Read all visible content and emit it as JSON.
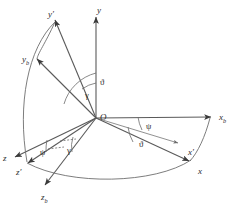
{
  "figure": {
    "kind": "euler-angle-coordinate-diagram",
    "background_color": "#ffffff",
    "line_color": "#5a5a5a",
    "text_color": "#2b2b2b",
    "origin_label": "O",
    "axes": [
      {
        "id": "y-prime",
        "label_main": "y",
        "label_prime": "′",
        "label_sub": "",
        "x": 48,
        "y": 10
      },
      {
        "id": "y",
        "label_main": "y",
        "label_prime": "",
        "label_sub": "",
        "x": 97,
        "y": 6
      },
      {
        "id": "y-b",
        "label_main": "y",
        "label_prime": "",
        "label_sub": "b",
        "x": 22,
        "y": 55
      },
      {
        "id": "x-b",
        "label_main": "x",
        "label_prime": "",
        "label_sub": "b",
        "x": 219,
        "y": 113
      },
      {
        "id": "x-prime",
        "label_main": "x",
        "label_prime": "′",
        "label_sub": "",
        "x": 188,
        "y": 148
      },
      {
        "id": "x",
        "label_main": "x",
        "label_prime": "",
        "label_sub": "",
        "x": 198,
        "y": 167
      },
      {
        "id": "z",
        "label_main": "z",
        "label_prime": "",
        "label_sub": "",
        "x": 3,
        "y": 154
      },
      {
        "id": "z-prime",
        "label_main": "z",
        "label_prime": "′",
        "label_sub": "",
        "x": 16,
        "y": 168
      },
      {
        "id": "z-b",
        "label_main": "z",
        "label_prime": "",
        "label_sub": "b",
        "x": 41,
        "y": 193
      }
    ],
    "angles": [
      {
        "id": "theta-upper",
        "glyph": "ϑ",
        "x": 100,
        "y": 78
      },
      {
        "id": "gamma-upper",
        "glyph": "γ",
        "x": 85,
        "y": 91
      },
      {
        "id": "psi-right",
        "glyph": "ψ",
        "x": 146,
        "y": 122
      },
      {
        "id": "theta-right",
        "glyph": "ϑ",
        "x": 139,
        "y": 140
      },
      {
        "id": "psi-left",
        "glyph": "ψ",
        "x": 40,
        "y": 148
      },
      {
        "id": "gamma-left",
        "glyph": "γ",
        "x": 67,
        "y": 146
      }
    ]
  }
}
